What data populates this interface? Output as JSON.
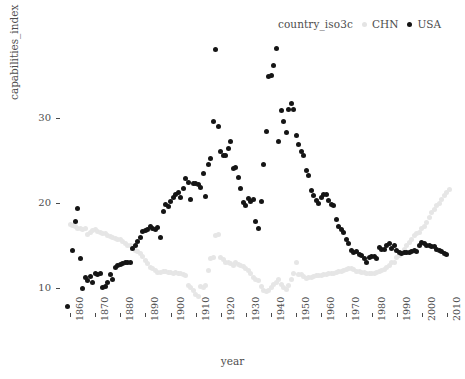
{
  "chart_data": {
    "type": "scatter",
    "title": "",
    "xlabel": "year",
    "ylabel": "capabilities_index",
    "legend_title": "country_iso3c",
    "legend_position": "top-right",
    "grid": false,
    "xlim": [
      1856,
      2014
    ],
    "ylim": [
      7,
      39
    ],
    "xticks": [
      1860,
      1870,
      1880,
      1890,
      1900,
      1910,
      1920,
      1930,
      1940,
      1950,
      1960,
      1970,
      1980,
      1990,
      2000,
      2010
    ],
    "yticks": [
      10,
      20,
      30
    ],
    "colors": {
      "CHN": "#e6e6e6",
      "USA": "#151515"
    },
    "series": [
      {
        "name": "USA",
        "color": "#151515",
        "points": [
          [
            1859,
            7.8
          ],
          [
            1861,
            14.4
          ],
          [
            1862,
            17.8
          ],
          [
            1863,
            19.3
          ],
          [
            1864,
            13.4
          ],
          [
            1865,
            9.9
          ],
          [
            1866,
            11.2
          ],
          [
            1867,
            10.8
          ],
          [
            1868,
            11.3
          ],
          [
            1869,
            10.6
          ],
          [
            1870,
            11.6
          ],
          [
            1871,
            11.5
          ],
          [
            1872,
            11.6
          ],
          [
            1873,
            10.0
          ],
          [
            1874,
            10.1
          ],
          [
            1875,
            10.6
          ],
          [
            1876,
            11.5
          ],
          [
            1877,
            10.9
          ],
          [
            1878,
            12.3
          ],
          [
            1879,
            12.6
          ],
          [
            1880,
            12.7
          ],
          [
            1881,
            12.8
          ],
          [
            1882,
            13.0
          ],
          [
            1883,
            12.9
          ],
          [
            1884,
            13.0
          ],
          [
            1885,
            14.6
          ],
          [
            1886,
            15.0
          ],
          [
            1887,
            15.4
          ],
          [
            1888,
            15.9
          ],
          [
            1889,
            16.6
          ],
          [
            1890,
            16.7
          ],
          [
            1891,
            16.8
          ],
          [
            1892,
            17.2
          ],
          [
            1893,
            17.0
          ],
          [
            1894,
            16.8
          ],
          [
            1895,
            17.1
          ],
          [
            1896,
            15.9
          ],
          [
            1897,
            18.9
          ],
          [
            1898,
            19.8
          ],
          [
            1899,
            19.5
          ],
          [
            1900,
            20.1
          ],
          [
            1901,
            20.6
          ],
          [
            1902,
            20.9
          ],
          [
            1903,
            21.2
          ],
          [
            1904,
            20.6
          ],
          [
            1905,
            21.6
          ],
          [
            1906,
            22.8
          ],
          [
            1907,
            22.4
          ],
          [
            1908,
            20.4
          ],
          [
            1909,
            22.2
          ],
          [
            1910,
            22.2
          ],
          [
            1911,
            22.1
          ],
          [
            1912,
            21.8
          ],
          [
            1913,
            23.4
          ],
          [
            1914,
            20.7
          ],
          [
            1915,
            24.5
          ],
          [
            1916,
            25.2
          ],
          [
            1917,
            29.5
          ],
          [
            1918,
            38.0
          ],
          [
            1919,
            28.9
          ],
          [
            1920,
            26.0
          ],
          [
            1921,
            25.5
          ],
          [
            1922,
            25.5
          ],
          [
            1923,
            26.4
          ],
          [
            1924,
            27.2
          ],
          [
            1925,
            24.0
          ],
          [
            1926,
            24.1
          ],
          [
            1927,
            22.9
          ],
          [
            1928,
            21.6
          ],
          [
            1929,
            20.0
          ],
          [
            1930,
            19.7
          ],
          [
            1931,
            20.5
          ],
          [
            1932,
            20.1
          ],
          [
            1933,
            20.4
          ],
          [
            1934,
            17.8
          ],
          [
            1935,
            17.0
          ],
          [
            1936,
            20.1
          ],
          [
            1937,
            24.5
          ],
          [
            1938,
            28.4
          ],
          [
            1939,
            34.8
          ],
          [
            1940,
            35.0
          ],
          [
            1941,
            36.1
          ],
          [
            1942,
            38.1
          ],
          [
            1943,
            27.2
          ],
          [
            1944,
            30.8
          ],
          [
            1945,
            29.5
          ],
          [
            1946,
            28.2
          ],
          [
            1947,
            31.0
          ],
          [
            1948,
            31.7
          ],
          [
            1949,
            30.9
          ],
          [
            1950,
            27.9
          ],
          [
            1951,
            26.8
          ],
          [
            1952,
            26.0
          ],
          [
            1953,
            25.5
          ],
          [
            1954,
            23.8
          ],
          [
            1955,
            23.2
          ],
          [
            1956,
            21.4
          ],
          [
            1957,
            20.8
          ],
          [
            1958,
            20.2
          ],
          [
            1959,
            19.9
          ],
          [
            1960,
            20.6
          ],
          [
            1961,
            20.9
          ],
          [
            1962,
            20.9
          ],
          [
            1963,
            20.2
          ],
          [
            1964,
            19.8
          ],
          [
            1965,
            19.6
          ],
          [
            1966,
            18.0
          ],
          [
            1967,
            17.2
          ],
          [
            1968,
            16.8
          ],
          [
            1969,
            16.5
          ],
          [
            1970,
            15.7
          ],
          [
            1971,
            15.2
          ],
          [
            1972,
            14.3
          ],
          [
            1973,
            14.1
          ],
          [
            1974,
            14.2
          ],
          [
            1975,
            13.9
          ],
          [
            1976,
            13.8
          ],
          [
            1977,
            13.4
          ],
          [
            1978,
            13.0
          ],
          [
            1979,
            13.5
          ],
          [
            1980,
            13.7
          ],
          [
            1981,
            13.7
          ],
          [
            1982,
            13.4
          ],
          [
            1983,
            14.7
          ],
          [
            1984,
            14.5
          ],
          [
            1985,
            14.5
          ],
          [
            1986,
            14.9
          ],
          [
            1987,
            15.2
          ],
          [
            1988,
            14.6
          ],
          [
            1989,
            14.9
          ],
          [
            1990,
            14.3
          ],
          [
            1991,
            14.1
          ],
          [
            1992,
            14.0
          ],
          [
            1993,
            14.1
          ],
          [
            1994,
            14.1
          ],
          [
            1995,
            14.1
          ],
          [
            1996,
            14.2
          ],
          [
            1997,
            14.3
          ],
          [
            1998,
            14.2
          ],
          [
            1999,
            14.9
          ],
          [
            2000,
            15.3
          ],
          [
            2001,
            15.2
          ],
          [
            2002,
            15.0
          ],
          [
            2003,
            14.9
          ],
          [
            2004,
            14.8
          ],
          [
            2005,
            14.8
          ],
          [
            2006,
            14.5
          ],
          [
            2007,
            14.4
          ],
          [
            2008,
            14.2
          ],
          [
            2009,
            14.0
          ],
          [
            2010,
            13.9
          ]
        ]
      },
      {
        "name": "CHN",
        "color": "#e6e6e6",
        "points": [
          [
            1860,
            17.4
          ],
          [
            1861,
            17.3
          ],
          [
            1862,
            17.2
          ],
          [
            1863,
            17.0
          ],
          [
            1864,
            16.9
          ],
          [
            1865,
            16.8
          ],
          [
            1866,
            16.9
          ],
          [
            1867,
            16.2
          ],
          [
            1868,
            16.5
          ],
          [
            1869,
            16.7
          ],
          [
            1870,
            16.8
          ],
          [
            1871,
            16.6
          ],
          [
            1872,
            16.5
          ],
          [
            1873,
            16.4
          ],
          [
            1874,
            16.3
          ],
          [
            1875,
            16.1
          ],
          [
            1876,
            16.0
          ],
          [
            1877,
            15.9
          ],
          [
            1878,
            15.8
          ],
          [
            1879,
            15.7
          ],
          [
            1880,
            15.6
          ],
          [
            1881,
            15.4
          ],
          [
            1882,
            15.2
          ],
          [
            1883,
            15.0
          ],
          [
            1884,
            14.9
          ],
          [
            1885,
            14.6
          ],
          [
            1886,
            14.4
          ],
          [
            1887,
            14.2
          ],
          [
            1888,
            14.0
          ],
          [
            1889,
            13.6
          ],
          [
            1890,
            13.2
          ],
          [
            1891,
            12.8
          ],
          [
            1892,
            12.4
          ],
          [
            1893,
            12.2
          ],
          [
            1894,
            12.0
          ],
          [
            1895,
            11.8
          ],
          [
            1896,
            11.8
          ],
          [
            1897,
            11.9
          ],
          [
            1898,
            11.9
          ],
          [
            1899,
            11.8
          ],
          [
            1900,
            11.8
          ],
          [
            1901,
            11.7
          ],
          [
            1902,
            11.8
          ],
          [
            1903,
            11.7
          ],
          [
            1904,
            11.6
          ],
          [
            1905,
            11.5
          ],
          [
            1906,
            11.4
          ],
          [
            1907,
            10.2
          ],
          [
            1908,
            10.0
          ],
          [
            1909,
            9.6
          ],
          [
            1910,
            9.2
          ],
          [
            1911,
            8.9
          ],
          [
            1912,
            10.1
          ],
          [
            1913,
            10.0
          ],
          [
            1914,
            10.2
          ],
          [
            1915,
            12.0
          ],
          [
            1916,
            13.4
          ],
          [
            1917,
            13.5
          ],
          [
            1918,
            16.1
          ],
          [
            1919,
            16.2
          ],
          [
            1920,
            13.5
          ],
          [
            1921,
            13.3
          ],
          [
            1922,
            13.0
          ],
          [
            1923,
            12.9
          ],
          [
            1924,
            12.8
          ],
          [
            1925,
            12.6
          ],
          [
            1926,
            12.9
          ],
          [
            1927,
            12.7
          ],
          [
            1928,
            12.6
          ],
          [
            1929,
            12.5
          ],
          [
            1930,
            12.2
          ],
          [
            1931,
            12.0
          ],
          [
            1932,
            11.7
          ],
          [
            1933,
            11.2
          ],
          [
            1934,
            11.0
          ],
          [
            1935,
            10.8
          ],
          [
            1936,
            10.1
          ],
          [
            1937,
            9.7
          ],
          [
            1938,
            9.5
          ],
          [
            1939,
            9.6
          ],
          [
            1940,
            10.0
          ],
          [
            1941,
            10.3
          ],
          [
            1942,
            10.6
          ],
          [
            1943,
            10.9
          ],
          [
            1944,
            10.3
          ],
          [
            1945,
            10.0
          ],
          [
            1946,
            9.8
          ],
          [
            1947,
            10.2
          ],
          [
            1948,
            11.0
          ],
          [
            1949,
            11.6
          ],
          [
            1950,
            13.0
          ],
          [
            1951,
            11.5
          ],
          [
            1952,
            11.5
          ],
          [
            1953,
            11.3
          ],
          [
            1954,
            11.1
          ],
          [
            1955,
            11.2
          ],
          [
            1956,
            11.2
          ],
          [
            1957,
            11.3
          ],
          [
            1958,
            11.4
          ],
          [
            1959,
            11.4
          ],
          [
            1960,
            11.4
          ],
          [
            1961,
            11.5
          ],
          [
            1962,
            11.5
          ],
          [
            1963,
            11.6
          ],
          [
            1964,
            11.6
          ],
          [
            1965,
            11.7
          ],
          [
            1966,
            11.8
          ],
          [
            1967,
            11.9
          ],
          [
            1968,
            11.9
          ],
          [
            1969,
            12.0
          ],
          [
            1970,
            12.1
          ],
          [
            1971,
            12.2
          ],
          [
            1972,
            12.2
          ],
          [
            1973,
            12.1
          ],
          [
            1974,
            11.9
          ],
          [
            1975,
            11.9
          ],
          [
            1976,
            11.8
          ],
          [
            1977,
            11.8
          ],
          [
            1978,
            11.7
          ],
          [
            1979,
            11.6
          ],
          [
            1980,
            11.6
          ],
          [
            1981,
            11.7
          ],
          [
            1982,
            11.8
          ],
          [
            1983,
            11.9
          ],
          [
            1984,
            12.0
          ],
          [
            1985,
            12.1
          ],
          [
            1986,
            12.3
          ],
          [
            1987,
            12.6
          ],
          [
            1988,
            12.9
          ],
          [
            1989,
            13.0
          ],
          [
            1990,
            13.5
          ],
          [
            1991,
            13.8
          ],
          [
            1992,
            14.1
          ],
          [
            1993,
            14.5
          ],
          [
            1994,
            14.9
          ],
          [
            1995,
            15.3
          ],
          [
            1996,
            15.7
          ],
          [
            1997,
            16.1
          ],
          [
            1998,
            16.3
          ],
          [
            1999,
            16.5
          ],
          [
            2000,
            16.9
          ],
          [
            2001,
            17.2
          ],
          [
            2002,
            17.6
          ],
          [
            2003,
            18.2
          ],
          [
            2004,
            18.8
          ],
          [
            2005,
            19.2
          ],
          [
            2006,
            19.6
          ],
          [
            2007,
            19.9
          ],
          [
            2008,
            20.3
          ],
          [
            2009,
            20.8
          ],
          [
            2010,
            21.2
          ],
          [
            2011,
            21.5
          ]
        ]
      }
    ]
  },
  "legend": {
    "title": "country_iso3c",
    "entries": [
      {
        "label": "CHN",
        "color": "#e6e6e6"
      },
      {
        "label": "USA",
        "color": "#151515"
      }
    ]
  },
  "axes": {
    "y_title": "capabilities_index",
    "x_title": "year"
  }
}
